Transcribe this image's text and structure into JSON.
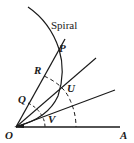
{
  "diagram": {
    "title": "Spiral",
    "labels": {
      "P": "P",
      "R": "R",
      "U": "U",
      "Q": "Q",
      "O": "O",
      "V": "V",
      "A": "A"
    },
    "line_color": "#1a1a1a",
    "background": "#ffffff"
  }
}
